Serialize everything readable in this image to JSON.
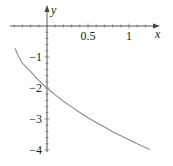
{
  "chart_data": {
    "type": "line",
    "title": "",
    "xlabel": "x",
    "ylabel": "y",
    "xlim": [
      -0.4,
      1.35
    ],
    "ylim": [
      -4.05,
      0.3
    ],
    "x_ticks": [
      {
        "value": 0.5,
        "label": "0.5"
      },
      {
        "value": 1,
        "label": "1"
      }
    ],
    "y_ticks": [
      {
        "value": -1,
        "label": "−1"
      },
      {
        "value": -2,
        "label": "−2"
      },
      {
        "value": -3,
        "label": "−3"
      },
      {
        "value": -4,
        "label": "−4"
      }
    ],
    "grid": false,
    "legend": null,
    "series": [
      {
        "name": "curve",
        "color": "#8a8a8a",
        "x": [
          -0.39,
          -0.35,
          -0.3,
          -0.2,
          -0.1,
          0,
          0.1,
          0.2,
          0.3,
          0.4,
          0.5,
          0.6,
          0.7,
          0.8,
          0.9,
          1.0,
          1.1,
          1.2,
          1.25
        ],
        "y": [
          -0.72,
          -0.97,
          -1.2,
          -1.47,
          -1.76,
          -2.0,
          -2.22,
          -2.43,
          -2.61,
          -2.79,
          -2.96,
          -3.11,
          -3.26,
          -3.41,
          -3.54,
          -3.67,
          -3.8,
          -3.92,
          -3.98
        ]
      }
    ]
  },
  "axes": {
    "axis_color": "#444444",
    "x_label": "x",
    "y_label": "y"
  }
}
